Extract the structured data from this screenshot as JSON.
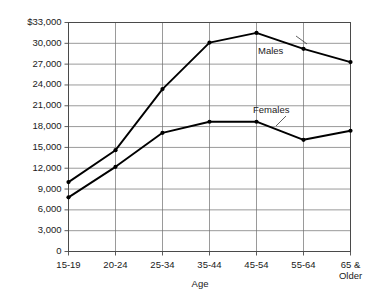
{
  "chart_data": {
    "type": "line",
    "title": "",
    "xlabel": "Age",
    "ylabel": "",
    "categories": [
      "15-19",
      "20-24",
      "25-34",
      "35-44",
      "45-54",
      "55-64",
      "65 & Older"
    ],
    "series": [
      {
        "name": "Males",
        "values": [
          10000,
          14600,
          23400,
          30100,
          31500,
          29200,
          27300
        ]
      },
      {
        "name": "Females",
        "values": [
          7800,
          12200,
          17100,
          18700,
          18700,
          16100,
          17400
        ]
      }
    ],
    "ylim": [
      0,
      33000
    ],
    "ytick_values": [
      0,
      3000,
      6000,
      9000,
      12000,
      15000,
      18000,
      21000,
      24000,
      27000,
      30000,
      33000
    ],
    "ytick_labels": [
      "0",
      "3,000",
      "6,000",
      "9,000",
      "12,000",
      "15,000",
      "18,000",
      "21,000",
      "24,000",
      "27,000",
      "30,000",
      "$33,000"
    ],
    "grid": true,
    "legend_position": "inline-annotations",
    "annotations": [
      {
        "text": "Males",
        "near_category": "45-54"
      },
      {
        "text": "Females",
        "near_category": "45-54"
      }
    ]
  },
  "axis": {
    "x_title": "Age",
    "categories": [
      "15-19",
      "20-24",
      "25-34",
      "35-44",
      "45-54",
      "55-64",
      "65 &"
    ],
    "last_category_line2": "Older",
    "y_labels": [
      "$33,000",
      "30,000",
      "27,000",
      "24,000",
      "21,000",
      "18,000",
      "15,000",
      "12,000",
      "9,000",
      "6,000",
      "3,000",
      "0"
    ]
  },
  "labels": {
    "males": "Males",
    "females": "Females"
  },
  "colors": {
    "line": "#000000",
    "grid": "#6e6e6e",
    "frame": "#4a4a4a",
    "background": "#ffffff"
  }
}
